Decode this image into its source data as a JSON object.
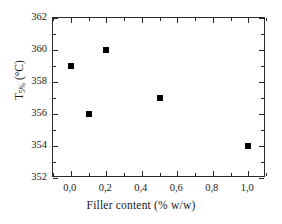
{
  "chart_data": {
    "type": "scatter",
    "title": "",
    "xlabel": "Filler content  (% w/w)",
    "ylabel": "T5% (°C)",
    "ylabel_parts": {
      "symbol": "T",
      "subscript": "5%",
      "unit": " (°C)"
    },
    "x": [
      0.0,
      0.1,
      0.2,
      0.5,
      1.0
    ],
    "values": [
      359,
      356,
      360,
      357,
      354
    ],
    "series": [
      {
        "name": "T5%",
        "points": [
          {
            "x": 0.0,
            "y": 359
          },
          {
            "x": 0.1,
            "y": 356
          },
          {
            "x": 0.2,
            "y": 360
          },
          {
            "x": 0.5,
            "y": 357
          },
          {
            "x": 1.0,
            "y": 354
          }
        ]
      }
    ],
    "xlim": [
      -0.1,
      1.1
    ],
    "ylim": [
      352,
      362
    ],
    "xticks": [
      0.0,
      0.2,
      0.4,
      0.6,
      0.8,
      1.0
    ],
    "xtick_labels": [
      "0,0",
      "0,2",
      "0,4",
      "0,6",
      "0,8",
      "1,0"
    ],
    "xticks_minor": [
      -0.1,
      0.1,
      0.3,
      0.5,
      0.7,
      0.9,
      1.1
    ],
    "yticks": [
      352,
      354,
      356,
      358,
      360,
      362
    ],
    "ytick_labels": [
      "352",
      "354",
      "356",
      "358",
      "360",
      "362"
    ],
    "yticks_minor": [
      353,
      355,
      357,
      359,
      361
    ],
    "grid": false,
    "legend": null,
    "marker_style": "filled-square",
    "marker_color": "#000000",
    "frame_color": "#2b2b2b",
    "background_color": "#ffffff"
  }
}
